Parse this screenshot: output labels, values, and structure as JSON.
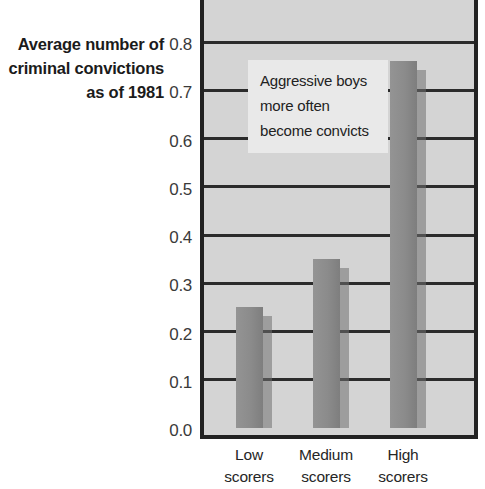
{
  "axis_title": {
    "lines": [
      "Average number of",
      "criminal convictions",
      "as of 1981"
    ]
  },
  "annotation": {
    "lines": [
      "Aggressive boys",
      "more often",
      "become convicts"
    ]
  },
  "colors": {
    "bar": "#8d8d8d",
    "bar_shadow": "#6f6f6f",
    "plot_background": "#d4d4d4",
    "gridline": "#2b2b2b",
    "frame": "#222222",
    "annotation_background": "#e9e9e9",
    "text": "#222222"
  },
  "chart_data": {
    "type": "bar",
    "title": "",
    "subtitle": "",
    "xlabel": "",
    "ylabel": "Average number of criminal convictions as of 1981",
    "categories": [
      "Low scorers",
      "Medium scorers",
      "High scorers"
    ],
    "category_lines": [
      [
        "Low",
        "scorers"
      ],
      [
        "Medium",
        "scorers"
      ],
      [
        "High",
        "scorers"
      ]
    ],
    "values": [
      0.25,
      0.35,
      0.76
    ],
    "ylim": [
      0.0,
      0.85
    ],
    "ytick_values": [
      0.0,
      0.1,
      0.2,
      0.3,
      0.4,
      0.5,
      0.6,
      0.7,
      0.8
    ],
    "ytick_labels": [
      "0.0",
      "0.1",
      "0.2",
      "0.3",
      "0.4",
      "0.5",
      "0.6",
      "0.7",
      "0.8"
    ],
    "grid": true,
    "grid_axis": "y",
    "legend": false,
    "legend_position": "none",
    "annotations": [
      {
        "text": "Aggressive boys more often become convicts",
        "x": 1.0,
        "y": 0.78
      }
    ],
    "series": [
      {
        "name": "Average convictions",
        "values": [
          0.25,
          0.35,
          0.76
        ]
      }
    ]
  }
}
